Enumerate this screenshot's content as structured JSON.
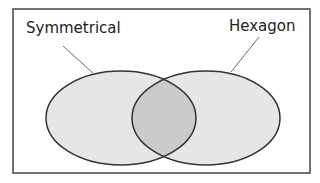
{
  "diagram": {
    "type": "venn",
    "sets": [
      {
        "label": "Symmetrical",
        "fill": "#e6e6e6"
      },
      {
        "label": "Hexagon",
        "fill": "#e6e6e6"
      }
    ],
    "intersection_fill": "#cbcbcb",
    "border_color": "#333333"
  }
}
